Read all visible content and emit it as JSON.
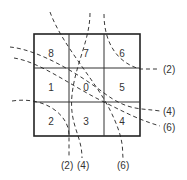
{
  "cells": [
    {
      "label": "8",
      "x": 51,
      "y": 57
    },
    {
      "label": "7",
      "x": 86,
      "y": 57
    },
    {
      "label": "6",
      "x": 122,
      "y": 57
    },
    {
      "label": "1",
      "x": 51,
      "y": 91
    },
    {
      "label": "0",
      "x": 86,
      "y": 91
    },
    {
      "label": "5",
      "x": 122,
      "y": 91
    },
    {
      "label": "2",
      "x": 51,
      "y": 125
    },
    {
      "label": "3",
      "x": 86,
      "y": 125
    },
    {
      "label": "4",
      "x": 122,
      "y": 125
    }
  ],
  "curve_labels": {
    "right_top": "(2)",
    "right_mid": "(4)",
    "right_bottom": "(6)",
    "bottom_left": "(2)",
    "bottom_mid": "(4)",
    "bottom_right": "(6)"
  },
  "colors": {
    "line": "#222222",
    "text": "#333333"
  }
}
